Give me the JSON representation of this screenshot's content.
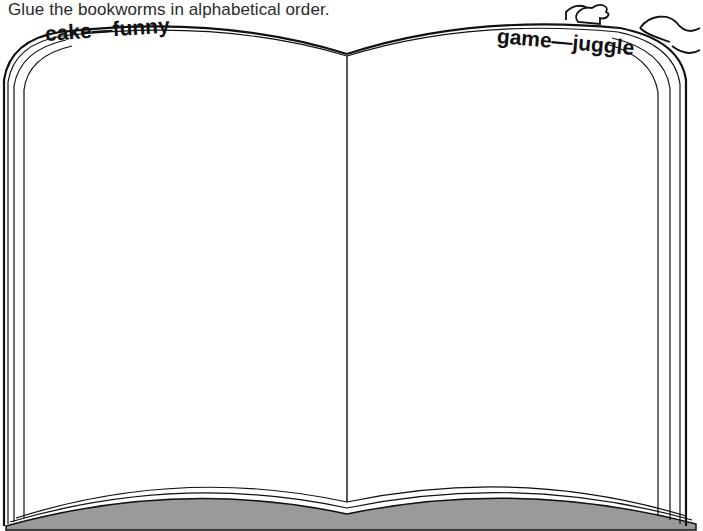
{
  "instruction": "Glue the bookworms in alphabetical order.",
  "book": {
    "left_page": {
      "guide_words": "cake—funny"
    },
    "right_page": {
      "guide_words": "game—juggle"
    }
  },
  "illustration": {
    "name": "bookworm"
  },
  "colors": {
    "line": "#111111",
    "page_edge_fill": "#9a9a9a",
    "background": "#ffffff"
  }
}
